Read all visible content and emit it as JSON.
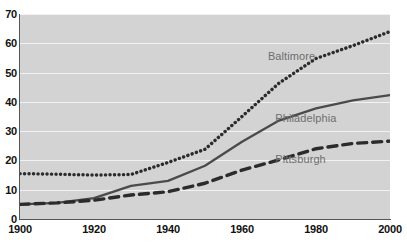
{
  "chart_data": {
    "type": "line",
    "title": "",
    "subtitle": "",
    "xlabel": "",
    "ylabel": "",
    "xlim": [
      1900,
      2000
    ],
    "ylim": [
      0,
      70
    ],
    "grid": "horizontal",
    "legend_position": "inline-right",
    "x_ticks": [
      "1900",
      "1920",
      "1940",
      "1960",
      "1980",
      "2000"
    ],
    "x_tick_values": [
      1900,
      1920,
      1940,
      1960,
      1980,
      2000
    ],
    "y_ticks": [
      "0",
      "10",
      "20",
      "30",
      "40",
      "50",
      "60",
      "70"
    ],
    "y_tick_values": [
      0,
      10,
      20,
      30,
      40,
      50,
      60,
      70
    ],
    "x": [
      1900,
      1910,
      1920,
      1930,
      1940,
      1950,
      1960,
      1970,
      1980,
      1990,
      2000
    ],
    "series": [
      {
        "name": "Baltimore",
        "style": "dotted",
        "color": "#2b2b2b",
        "values": [
          15.5,
          15.3,
          15.0,
          15.2,
          19.3,
          23.8,
          35.0,
          46.4,
          54.8,
          59.2,
          64.0
        ],
        "label_x": 1967,
        "label_y": 55.5
      },
      {
        "name": "Philadelphia",
        "style": "solid",
        "color": "#4a4a4a",
        "values": [
          5.0,
          5.5,
          7.1,
          11.3,
          13.0,
          18.2,
          26.4,
          33.6,
          37.8,
          40.5,
          42.3
        ],
        "label_x": 1969,
        "label_y": 34.5
      },
      {
        "name": "Pittsburgh",
        "style": "dashed",
        "color": "#2b2b2b",
        "values": [
          5.0,
          5.5,
          6.4,
          8.2,
          9.3,
          12.2,
          16.7,
          20.2,
          24.0,
          25.8,
          26.6
        ],
        "label_x": 1969,
        "label_y": 20.5
      }
    ]
  },
  "colors": {
    "plot_background": "#d3d3d3",
    "page_background": "#ffffff",
    "gridline": "#f2f2f2",
    "axis": "#555555",
    "tick_text": "#111111",
    "series_label_text": "#6e6e6e"
  }
}
